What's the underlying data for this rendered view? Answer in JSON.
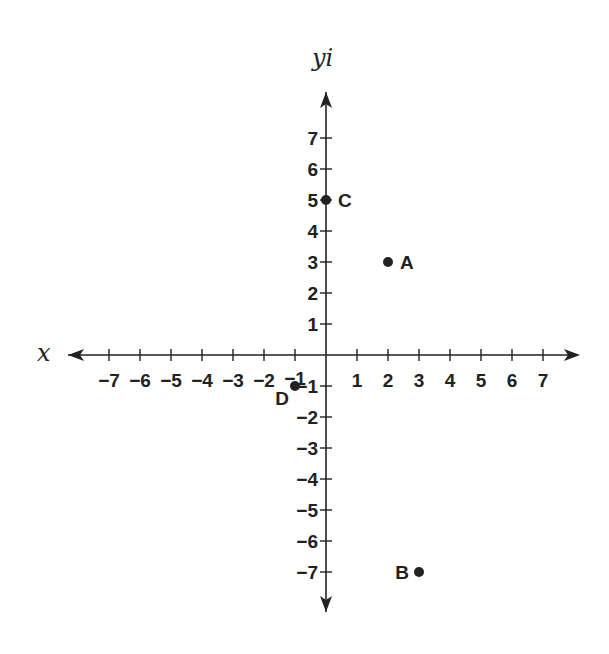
{
  "chart_data": {
    "type": "scatter",
    "title": "",
    "xlabel": "x",
    "ylabel": "yi",
    "xlim": [
      -8,
      8
    ],
    "ylim": [
      -8,
      8
    ],
    "grid": false,
    "legend": null,
    "x_ticks": [
      -7,
      -6,
      -5,
      -4,
      -3,
      -2,
      -1,
      1,
      2,
      3,
      4,
      5,
      6,
      7
    ],
    "y_ticks": [
      -7,
      -6,
      -5,
      -4,
      -3,
      -2,
      -1,
      1,
      2,
      3,
      4,
      5,
      6,
      7
    ],
    "x_tick_labels": [
      "−7",
      "−6",
      "−5",
      "−4",
      "−3",
      "−2",
      "−1",
      "1",
      "2",
      "3",
      "4",
      "5",
      "6",
      "7"
    ],
    "y_tick_labels": [
      "−7",
      "−6",
      "−5",
      "−4",
      "−3",
      "−2",
      "−1",
      "1",
      "2",
      "3",
      "4",
      "5",
      "6",
      "7"
    ],
    "points": [
      {
        "label": "A",
        "x": 2,
        "y": 3
      },
      {
        "label": "B",
        "x": 3,
        "y": -7
      },
      {
        "label": "C",
        "x": 0,
        "y": 5
      },
      {
        "label": "D",
        "x": -1,
        "y": -1
      }
    ]
  },
  "layout": {
    "origin_px": [
      326,
      355
    ],
    "unit_px": 31,
    "x_axis_px": [
      68,
      578
    ],
    "y_axis_px": [
      92,
      612
    ],
    "ink_color": "#222222"
  }
}
